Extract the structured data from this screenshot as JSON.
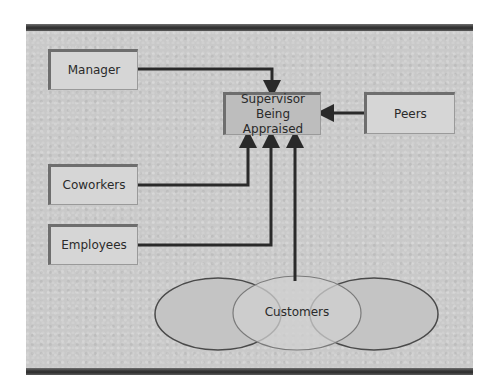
{
  "diagram": {
    "nodes": {
      "manager": "Manager",
      "supervisor_line1": "Supervisor",
      "supervisor_line2": "Being Appraised",
      "peers": "Peers",
      "coworkers": "Coworkers",
      "employees": "Employees",
      "customers": "Customers"
    },
    "edges": [
      {
        "from": "Manager",
        "to": "Supervisor Being Appraised"
      },
      {
        "from": "Peers",
        "to": "Supervisor Being Appraised"
      },
      {
        "from": "Coworkers",
        "to": "Supervisor Being Appraised"
      },
      {
        "from": "Employees",
        "to": "Supervisor Being Appraised"
      },
      {
        "from": "Customers",
        "to": "Supervisor Being Appraised"
      }
    ],
    "colors": {
      "background": "#c9c9c9",
      "box": "#d6d6d6",
      "supervisor_box": "#bdbdbd",
      "line": "#2a2a2a"
    }
  }
}
